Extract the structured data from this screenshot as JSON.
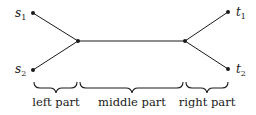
{
  "diagram": {
    "nodes": {
      "s1": {
        "label": "s",
        "sub": "1"
      },
      "s2": {
        "label": "s",
        "sub": "2"
      },
      "t1": {
        "label": "t",
        "sub": "1"
      },
      "t2": {
        "label": "t",
        "sub": "2"
      }
    },
    "edges": [
      [
        "s1",
        "left-junction"
      ],
      [
        "s2",
        "left-junction"
      ],
      [
        "left-junction",
        "right-junction"
      ],
      [
        "right-junction",
        "t1"
      ],
      [
        "right-junction",
        "t2"
      ]
    ],
    "parts": {
      "left": "left part",
      "middle": "middle part",
      "right": "right part"
    },
    "colors": {
      "stroke": "#1a1a1a"
    }
  }
}
